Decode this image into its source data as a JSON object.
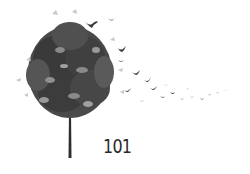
{
  "image": {
    "subject": "tree with leaves turning into birds flying away",
    "caption": "101",
    "colors": {
      "background": "#ffffff",
      "canopy_dark": "#3a3a3a",
      "canopy_mid": "#6a6a6a",
      "leaf_light": "#c8c8c8",
      "trunk": "#2e2e2e",
      "text": "#2a2a2a"
    }
  }
}
